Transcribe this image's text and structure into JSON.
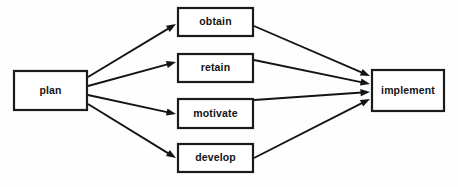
{
  "diagram": {
    "colors": {
      "background": "#fefefe",
      "node_fill": "#ffffff",
      "stroke": "#1b1b1b",
      "text": "#131313"
    },
    "nodes": [
      {
        "id": "plan",
        "label": "plan",
        "x": 14,
        "y": 71,
        "w": 73,
        "h": 39
      },
      {
        "id": "obtain",
        "label": "obtain",
        "x": 178,
        "y": 8,
        "w": 75,
        "h": 28
      },
      {
        "id": "retain",
        "label": "retain",
        "x": 178,
        "y": 54,
        "w": 75,
        "h": 28
      },
      {
        "id": "motivate",
        "label": "motivate",
        "x": 178,
        "y": 99,
        "w": 75,
        "h": 29
      },
      {
        "id": "develop",
        "label": "develop",
        "x": 178,
        "y": 144,
        "w": 75,
        "h": 28
      },
      {
        "id": "implement",
        "label": "implement",
        "x": 372,
        "y": 70,
        "w": 72,
        "h": 41
      }
    ],
    "edges": [
      {
        "id": "plan-to-obtain",
        "from": "plan",
        "to": "obtain",
        "x1": 88,
        "y1": 77,
        "x2": 176,
        "y2": 24
      },
      {
        "id": "plan-to-retain",
        "from": "plan",
        "to": "retain",
        "x1": 88,
        "y1": 86,
        "x2": 176,
        "y2": 62
      },
      {
        "id": "plan-to-motivate",
        "from": "plan",
        "to": "motivate",
        "x1": 88,
        "y1": 95,
        "x2": 176,
        "y2": 114
      },
      {
        "id": "plan-to-develop",
        "from": "plan",
        "to": "develop",
        "x1": 88,
        "y1": 104,
        "x2": 176,
        "y2": 158
      },
      {
        "id": "obtain-to-implement",
        "from": "obtain",
        "to": "implement",
        "x1": 254,
        "y1": 26,
        "x2": 370,
        "y2": 76
      },
      {
        "id": "retain-to-implement",
        "from": "retain",
        "to": "implement",
        "x1": 254,
        "y1": 60,
        "x2": 370,
        "y2": 84
      },
      {
        "id": "motivate-to-implement",
        "from": "motivate",
        "to": "implement",
        "x1": 254,
        "y1": 100,
        "x2": 370,
        "y2": 92
      },
      {
        "id": "develop-to-implement",
        "from": "develop",
        "to": "implement",
        "x1": 254,
        "y1": 158,
        "x2": 370,
        "y2": 99
      }
    ]
  }
}
